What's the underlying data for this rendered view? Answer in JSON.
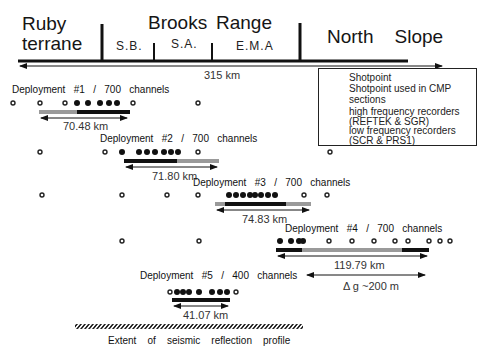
{
  "header": {
    "regions": {
      "ruby_line1": "Ruby",
      "ruby_line2": "terrane",
      "brooks": "Brooks",
      "range": "Range",
      "north_slope": "North    Slope"
    },
    "subregions": [
      "S.B.",
      "S.A.",
      "E.M.A"
    ],
    "total_length": "315 km"
  },
  "legend": {
    "items": [
      {
        "symbol": "open-circle",
        "label": "Shotpoint"
      },
      {
        "symbol": "filled-circle",
        "label": "Shotpoint used in CMP sections"
      },
      {
        "symbol": "black-bar",
        "label": "high frequency recorders (REFTEK & SGR)"
      },
      {
        "symbol": "gray-bar",
        "label": "low frequency recorders (SCR & PRS1)"
      }
    ],
    "l1": "Shotpoint",
    "l2a": "Shotpoint used in CMP",
    "l2b": "sections",
    "l3a": "high frequency recorders",
    "l3b": "(REFTEK & SGR)",
    "l4a": "low frequency recorders",
    "l4b": "(SCR & PRS1)"
  },
  "deployments": [
    {
      "label": "Deployment   #1   /   700   channels",
      "length": "70.48 km"
    },
    {
      "label": "Deployment   #2   /   700   channels",
      "length": "71.80 km"
    },
    {
      "label": "Deployment   #3   /   700   channels",
      "length": "74.83 km"
    },
    {
      "label": "Deployment   #4   /   700   channels",
      "length": "119.79 km",
      "spacing": "Δ g ~200 m"
    },
    {
      "label": "Deployment   #5   /   400   channels",
      "length": "41.07 km"
    }
  ],
  "footer": {
    "extent_label": "Extent    of    seismic    reflection    profile"
  },
  "colors": {
    "high_freq": "#111111",
    "low_freq": "#9a9a9a"
  }
}
